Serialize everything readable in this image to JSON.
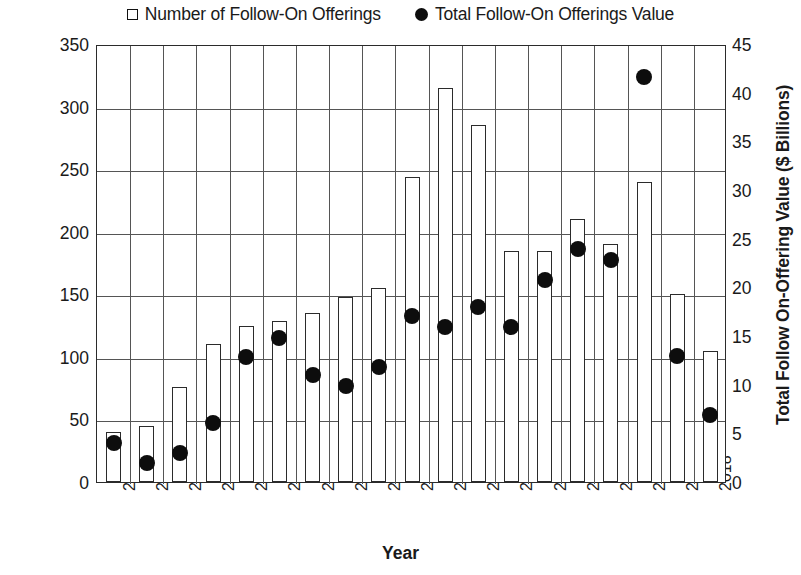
{
  "legend": [
    {
      "marker": "bar-swatch-icon",
      "label": "Number of Follow-On Offerings"
    },
    {
      "marker": "dot-swatch-icon",
      "label": "Total Follow-On Offerings Value"
    }
  ],
  "axis_titles": {
    "left": "Number of Follow-On Offerings",
    "right": "Total Follow On-Offering Value ($ Billions)",
    "bottom": "Year"
  },
  "chart_data": {
    "type": "bar",
    "title": "",
    "xlabel": "Year",
    "ylabel": "Number of Follow-On Offerings",
    "y2label": "Total Follow On-Offering Value ($ Billions)",
    "ylim": [
      0,
      350
    ],
    "y2lim": [
      0,
      45
    ],
    "yticks": [
      0,
      50,
      100,
      150,
      200,
      250,
      300,
      350
    ],
    "y2ticks": [
      0,
      5,
      10,
      15,
      20,
      25,
      30,
      35,
      40,
      45
    ],
    "grid": true,
    "legend_position": "top-center",
    "categories": [
      "2000",
      "2001",
      "2002",
      "2003",
      "2004",
      "2005",
      "2006",
      "2007",
      "2008",
      "2009",
      "2010",
      "2011",
      "2012",
      "2013",
      "2014",
      "2015",
      "2016",
      "2017",
      "2018"
    ],
    "series": [
      {
        "name": "Number of Follow-On Offerings",
        "type": "bar",
        "axis": "left",
        "values": [
          40,
          45,
          76,
          110,
          125,
          129,
          135,
          148,
          155,
          244,
          315,
          285,
          185,
          185,
          210,
          190,
          240,
          150,
          105
        ]
      },
      {
        "name": "Total Follow-On Offerings Value",
        "type": "scatter",
        "axis": "right",
        "values": [
          4.2,
          2.2,
          3.2,
          6.3,
          13.0,
          15.0,
          11.2,
          10.1,
          12.0,
          17.3,
          16.1,
          18.2,
          16.1,
          21.0,
          24.1,
          23.0,
          41.8,
          13.1,
          7.1
        ]
      }
    ]
  }
}
